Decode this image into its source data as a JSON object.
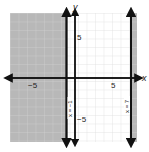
{
  "graph": {
    "x_axis_label": "x",
    "y_axis_label": "y",
    "x_tick_neg": "−5",
    "x_tick_pos": "5",
    "y_tick_pos": "5",
    "y_tick_neg": "−5",
    "x_range": [
      -8,
      7.5
    ],
    "y_range": [
      -7.5,
      7.5
    ],
    "lines": [
      {
        "equation": "x = −1",
        "x": -1,
        "style": "solid"
      },
      {
        "equation": "x = 7",
        "x": 7,
        "style": "solid"
      }
    ],
    "shaded_regions": [
      {
        "description": "x < -1",
        "color": "#b8b8b8"
      },
      {
        "description": "x > 7",
        "color": "#b8b8b8"
      }
    ],
    "grid": true
  }
}
